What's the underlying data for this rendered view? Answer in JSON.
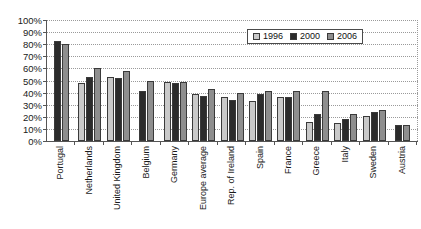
{
  "chart_data": {
    "type": "bar",
    "title": "",
    "xlabel": "",
    "ylabel": "",
    "ylim": [
      0,
      100
    ],
    "ytick_labels": [
      "100%",
      "90%",
      "80%",
      "70%",
      "60%",
      "50%",
      "40%",
      "30%",
      "20%",
      "10%",
      "0%"
    ],
    "ytick_values": [
      100,
      90,
      80,
      70,
      60,
      50,
      40,
      30,
      20,
      10,
      0
    ],
    "grid": true,
    "legend_position": "top-right",
    "categories": [
      "Portugal",
      "Netherlands",
      "United Kingdom",
      "Belgium",
      "Germany",
      "Europe average",
      "Rep. of Ireland",
      "Spain",
      "France",
      "Greece",
      "Italy",
      "Sweden",
      "Austria"
    ],
    "series": [
      {
        "name": "1996",
        "color": "#c9c9c9",
        "values": [
          null,
          48,
          53,
          null,
          49,
          39,
          36,
          33,
          36,
          16,
          15,
          21,
          null
        ]
      },
      {
        "name": "2000",
        "color": "#2b2b2b",
        "values": [
          83,
          53,
          52,
          41,
          48,
          37,
          34,
          39,
          36,
          22,
          18,
          24,
          13
        ]
      },
      {
        "name": "2006",
        "color": "#8e8e8e",
        "values": [
          80,
          60,
          58,
          50,
          49,
          43,
          40,
          41,
          41,
          41,
          22,
          26,
          13
        ]
      }
    ]
  },
  "legend": {
    "items": [
      {
        "label": "1996",
        "key": "y1996"
      },
      {
        "label": "2000",
        "key": "y2000"
      },
      {
        "label": "2006",
        "key": "y2006"
      }
    ]
  }
}
